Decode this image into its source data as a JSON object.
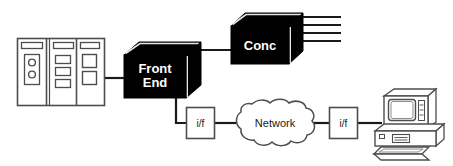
{
  "diagram": {
    "type": "network-topology",
    "title": "",
    "canvas": {
      "width": 453,
      "height": 166
    },
    "palette": {
      "background": "#ffffff",
      "box_fill": "#000000",
      "box_text": "#ffffff",
      "line": "#1a1a1a",
      "outline": "#4d4d4d",
      "shade": "#333333",
      "highlight": "#e6e6e6"
    },
    "nodes": [
      {
        "id": "mainframe",
        "name": "mainframe-cabinet",
        "label": "",
        "shape": "cabinet",
        "panels": 3
      },
      {
        "id": "front-end",
        "name": "front-end-box",
        "label": "Front End",
        "label_line1": "Front",
        "label_line2": "End",
        "shape": "cube-3d",
        "fill": "black"
      },
      {
        "id": "concentrator",
        "name": "concentrator-box",
        "label": "Conc",
        "shape": "cube-3d",
        "fill": "black",
        "fanout_lines": 4
      },
      {
        "id": "interface-left",
        "name": "interface-box-left",
        "label": "i/f",
        "shape": "rectangle"
      },
      {
        "id": "network-cloud",
        "name": "network-cloud",
        "label": "Network",
        "shape": "cloud"
      },
      {
        "id": "interface-right",
        "name": "interface-box-right",
        "label": "i/f",
        "shape": "rectangle"
      },
      {
        "id": "workstation",
        "name": "workstation-computer",
        "label": "",
        "shape": "desktop-computer"
      }
    ],
    "links": [
      {
        "from": "mainframe",
        "to": "front-end",
        "style": "solid"
      },
      {
        "from": "front-end",
        "to": "concentrator",
        "style": "solid"
      },
      {
        "from": "front-end",
        "to": "interface-left",
        "style": "solid-elbow"
      },
      {
        "from": "interface-left",
        "to": "network-cloud",
        "style": "solid"
      },
      {
        "from": "network-cloud",
        "to": "interface-right",
        "style": "solid"
      },
      {
        "from": "interface-right",
        "to": "workstation",
        "style": "solid"
      }
    ]
  }
}
